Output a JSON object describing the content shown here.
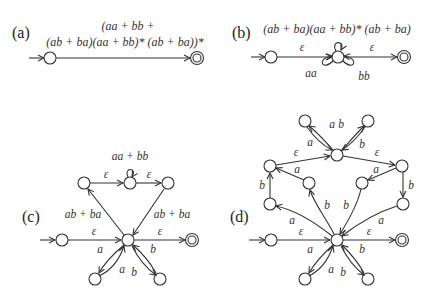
{
  "figure": {
    "panels": [
      {
        "id": "a",
        "label": "(a)",
        "expression_line1": "(aa + bb +",
        "expression_line2": "(ab + ba)(aa + bb)* (ab + ba))*"
      },
      {
        "id": "b",
        "label": "(b)",
        "expression": "(ab + ba)(aa + bb)* (ab + ba)",
        "edge_labels": {
          "in": "ε",
          "out": "ε",
          "loop_left": "aa",
          "loop_right": "bb"
        }
      },
      {
        "id": "c",
        "label": "(c)",
        "edge_labels": {
          "loop_top": "aa + bb",
          "top_left": "ε",
          "top_right": "ε",
          "left_diag": "ab + ba",
          "right_diag": "ab + ba",
          "in": "ε",
          "out": "ε",
          "bottom_left_out": "a",
          "bottom_left_in": "a",
          "bottom_right_in": "b",
          "bottom_right_out": "b"
        }
      },
      {
        "id": "d",
        "label": "(d)",
        "edge_labels": {
          "upper_left_a": "a",
          "upper_left_b": "b",
          "upper_right_a": "a",
          "upper_right_b": "b",
          "top_left_eps": "ε",
          "top_left_a": "a",
          "top_right_eps": "ε",
          "top_right_a": "a",
          "left_b": "b",
          "right_b": "b",
          "mid_left_b": "b",
          "mid_right_b": "b",
          "left_a": "a",
          "right_a": "a",
          "in": "ε",
          "out": "ε",
          "bottom_left_a": "a",
          "bottom_left_a2": "a",
          "bottom_right_b": "b",
          "bottom_right_b2": "b"
        }
      }
    ]
  }
}
